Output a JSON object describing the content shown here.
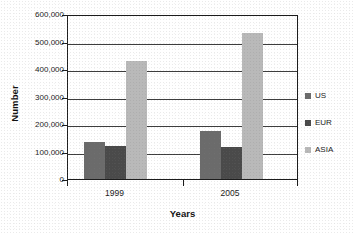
{
  "chart_data": {
    "type": "bar",
    "title": "",
    "subtitle": "",
    "xlabel": "Years",
    "ylabel": "Number",
    "categories": [
      "1999",
      "2005"
    ],
    "series": [
      {
        "name": "US",
        "values": [
          135000,
          175000
        ],
        "color": "#6b6b6b"
      },
      {
        "name": "EUR",
        "values": [
          120000,
          115000
        ],
        "color": "#4a4a4a"
      },
      {
        "name": "ASIA",
        "values": [
          428000,
          532000
        ],
        "color": "#b9b9b9"
      }
    ],
    "ylim": [
      0,
      600000
    ],
    "ytick_values": [
      0,
      100000,
      200000,
      300000,
      400000,
      500000,
      600000
    ],
    "ytick_labels": [
      "0",
      "100,000",
      "200,000",
      "300,000",
      "400,000",
      "500,000",
      "600,000"
    ],
    "grid": "horizontal",
    "legend_position": "right",
    "annotations": []
  },
  "axes": {
    "y_title": "Number",
    "x_title": "Years"
  },
  "legend": {
    "items": [
      {
        "label": "US"
      },
      {
        "label": "EUR"
      },
      {
        "label": "ASIA"
      }
    ]
  },
  "colors": {
    "us": "#6b6b6b",
    "eur": "#4a4a4a",
    "asia": "#b9b9b9",
    "axis": "#1c1c1c",
    "gridline": "#3d3d3d",
    "plot_background": "#ffffff"
  }
}
